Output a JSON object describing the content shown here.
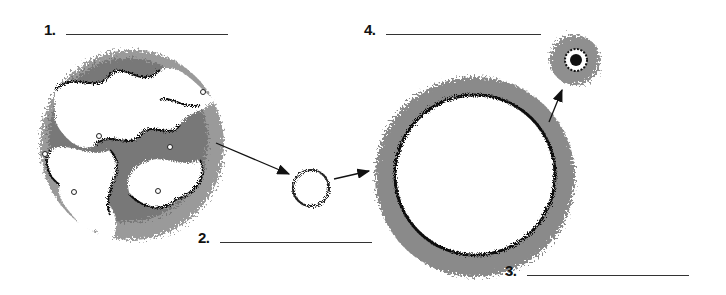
{
  "diagram": {
    "type": "life-cycle-sequence",
    "stages": [
      {
        "id": "stage-1",
        "number_label": "1.",
        "answer_blank": "",
        "illustration": "nebula"
      },
      {
        "id": "stage-2",
        "number_label": "2.",
        "answer_blank": "",
        "illustration": "small-star"
      },
      {
        "id": "stage-3",
        "number_label": "3.",
        "answer_blank": "",
        "illustration": "giant-star"
      },
      {
        "id": "stage-4",
        "number_label": "4.",
        "answer_blank": "",
        "illustration": "planetary-nebula-with-core"
      }
    ],
    "arrows": [
      {
        "from": "stage-1",
        "to": "stage-2"
      },
      {
        "from": "stage-2",
        "to": "stage-3"
      },
      {
        "from": "stage-3",
        "to": "stage-4"
      }
    ],
    "colors": {
      "ink": "#111111",
      "line": "#333333",
      "gray_dark": "#555555",
      "gray_mid": "#8a8a8a",
      "gray_light": "#b5b5b5",
      "background": "#ffffff"
    }
  }
}
